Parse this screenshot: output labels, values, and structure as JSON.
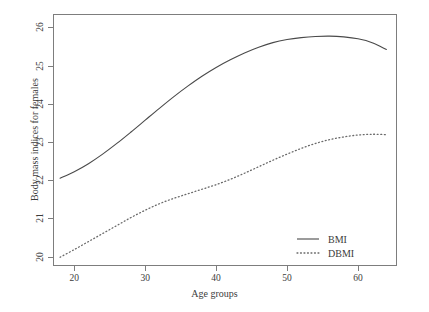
{
  "chart_data": {
    "type": "line",
    "title": "",
    "xlabel": "Age groups",
    "ylabel": "Body mass indices for females",
    "xlim": [
      17.0,
      65.5
    ],
    "ylim": [
      19.75,
      26.35
    ],
    "xticks": [
      20,
      30,
      40,
      50,
      60
    ],
    "yticks": [
      20,
      21,
      22,
      23,
      24,
      25,
      26
    ],
    "xtick_labels": [
      "20",
      "30",
      "40",
      "50",
      "60"
    ],
    "ytick_labels": [
      "20",
      "21",
      "22",
      "23",
      "24",
      "25",
      "26"
    ],
    "grid": false,
    "legend_position": "lower right",
    "x": [
      18,
      20,
      22,
      24,
      26,
      28,
      30,
      32,
      34,
      36,
      38,
      40,
      42,
      44,
      46,
      48,
      50,
      52,
      54,
      56,
      58,
      60,
      62,
      64
    ],
    "series": [
      {
        "name": "BMI",
        "style": "solid",
        "color": "#4a4a4a",
        "values": [
          22.05,
          22.22,
          22.43,
          22.68,
          22.96,
          23.26,
          23.57,
          23.88,
          24.18,
          24.46,
          24.72,
          24.95,
          25.15,
          25.33,
          25.48,
          25.6,
          25.68,
          25.73,
          25.76,
          25.77,
          25.75,
          25.7,
          25.6,
          25.42
        ]
      },
      {
        "name": "DBMI",
        "style": "dotted",
        "color": "#6a6a6a",
        "values": [
          19.98,
          20.18,
          20.39,
          20.6,
          20.81,
          21.02,
          21.21,
          21.38,
          21.52,
          21.64,
          21.76,
          21.88,
          22.02,
          22.18,
          22.35,
          22.52,
          22.68,
          22.83,
          22.96,
          23.06,
          23.13,
          23.18,
          23.2,
          23.19
        ]
      }
    ]
  },
  "legend": {
    "entries": [
      {
        "label": "BMI",
        "style": "solid"
      },
      {
        "label": "DBMI",
        "style": "dotted"
      }
    ]
  },
  "colors": {
    "axis": "#7d7d7d",
    "text": "#3c3c3c",
    "bmi_line": "#4a4a4a",
    "dbmi_line": "#6a6a6a",
    "background": "#ffffff"
  }
}
